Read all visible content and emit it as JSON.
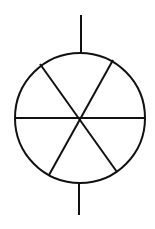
{
  "diagram": {
    "stroke_color": "#111111",
    "background_color": "#ffffff",
    "circle": {
      "cx": 80,
      "cy": 118,
      "r": 65
    },
    "top_lead": {
      "x1": 81,
      "y1": 15,
      "x2": 81,
      "y2": 53
    },
    "bottom_lead": {
      "x1": 79,
      "y1": 183,
      "x2": 79,
      "y2": 215
    },
    "spokes": [
      {
        "name": "horizontal",
        "x1": 15,
        "y1": 118,
        "x2": 145,
        "y2": 118
      },
      {
        "name": "diagonal-a",
        "x1": 40,
        "y1": 64,
        "x2": 117,
        "y2": 172
      },
      {
        "name": "diagonal-b",
        "x1": 113,
        "y1": 60,
        "x2": 49,
        "y2": 175
      }
    ]
  }
}
